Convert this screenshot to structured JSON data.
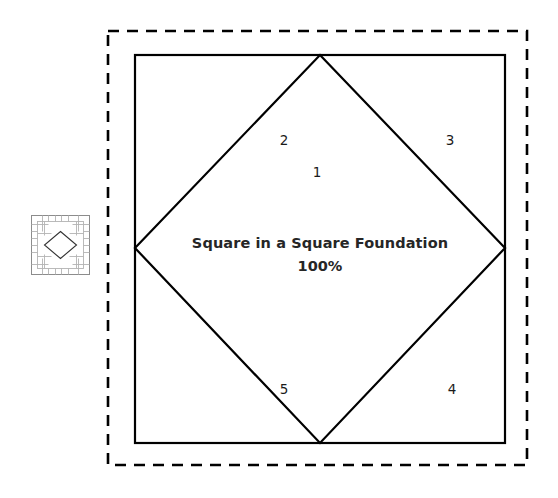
{
  "canvas": {
    "background_color": "#ffffff",
    "line_color": "#000000",
    "text_color": "#262626"
  },
  "thumbnail": {
    "name": "square-in-a-square-block-preview",
    "grid_color": "#b0b0b0",
    "outline_color": "#8c8c8c",
    "diamond_color": "#333333"
  },
  "pattern": {
    "outer_border_style": "dashed",
    "outer_border_color": "#000000",
    "block_border_color": "#000000",
    "title": "Square in a Square Foundation",
    "scale": "100%",
    "sections": [
      {
        "id": "1",
        "label": "1",
        "position": "center-top"
      },
      {
        "id": "2",
        "label": "2",
        "position": "top-left"
      },
      {
        "id": "3",
        "label": "3",
        "position": "top-right"
      },
      {
        "id": "4",
        "label": "4",
        "position": "bottom-right"
      },
      {
        "id": "5",
        "label": "5",
        "position": "bottom-left"
      }
    ]
  }
}
